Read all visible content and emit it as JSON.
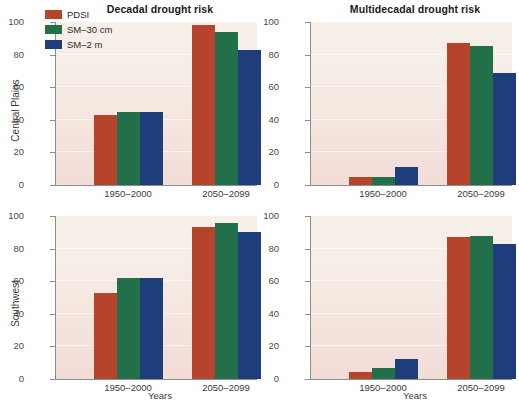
{
  "figure": {
    "xaxis_title": "Years",
    "row_labels": [
      "Central Plains",
      "Southwest"
    ],
    "column_titles": [
      "Decadal drought risk",
      "Multidecadal drought risk"
    ]
  },
  "legend": {
    "position": "top-left of first panel",
    "entries": [
      {
        "label": "PDSI",
        "color": "#b6442c"
      },
      {
        "label": "SM–30 cm",
        "color": "#22704a"
      },
      {
        "label": "SM–2 m",
        "color": "#1f3d7a"
      }
    ]
  },
  "axis": {
    "yticks": [
      0,
      20,
      40,
      60,
      80,
      100
    ],
    "ytick_labels": [
      "0",
      "20",
      "40",
      "60",
      "80",
      "100"
    ],
    "ylim": [
      0,
      100
    ],
    "xtick_labels": [
      "1950–2000",
      "2050–2099"
    ]
  },
  "chart_data": [
    {
      "type": "bar",
      "title": "Decadal drought risk",
      "panel": "Central Plains – Decadal drought risk",
      "region": "Central Plains",
      "categories": [
        "1950–2000",
        "2050–2099"
      ],
      "series": [
        {
          "name": "PDSI",
          "color": "#b6442c",
          "values": [
            43,
            98
          ]
        },
        {
          "name": "SM–30 cm",
          "color": "#22704a",
          "values": [
            45,
            94
          ]
        },
        {
          "name": "SM–2 m",
          "color": "#1f3d7a",
          "values": [
            45,
            83
          ]
        }
      ],
      "xlabel": "Years",
      "ylabel": "Central Plains",
      "ylim": [
        0,
        100
      ],
      "grid": true,
      "legend": "inside top-left"
    },
    {
      "type": "bar",
      "title": "Multidecadal drought risk",
      "panel": "Central Plains – Multidecadal drought risk",
      "region": "Central Plains",
      "categories": [
        "1950–2000",
        "2050–2099"
      ],
      "series": [
        {
          "name": "PDSI",
          "color": "#b6442c",
          "values": [
            5,
            87
          ]
        },
        {
          "name": "SM–30 cm",
          "color": "#22704a",
          "values": [
            5,
            85
          ]
        },
        {
          "name": "SM–2 m",
          "color": "#1f3d7a",
          "values": [
            11,
            69
          ]
        }
      ],
      "xlabel": "Years",
      "ylabel": "",
      "ylim": [
        0,
        100
      ],
      "grid": true,
      "legend": "none"
    },
    {
      "type": "bar",
      "title": "",
      "panel": "Southwest – Decadal drought risk",
      "region": "Southwest",
      "categories": [
        "1950–2000",
        "2050–2099"
      ],
      "series": [
        {
          "name": "PDSI",
          "color": "#b6442c",
          "values": [
            53,
            93
          ]
        },
        {
          "name": "SM–30 cm",
          "color": "#22704a",
          "values": [
            62,
            96
          ]
        },
        {
          "name": "SM–2 m",
          "color": "#1f3d7a",
          "values": [
            62,
            90
          ]
        }
      ],
      "xlabel": "Years",
      "ylabel": "Southwest",
      "ylim": [
        0,
        100
      ],
      "grid": true,
      "legend": "none"
    },
    {
      "type": "bar",
      "title": "",
      "panel": "Southwest – Multidecadal drought risk",
      "region": "Southwest",
      "categories": [
        "1950–2000",
        "2050–2099"
      ],
      "series": [
        {
          "name": "PDSI",
          "color": "#b6442c",
          "values": [
            4,
            87
          ]
        },
        {
          "name": "SM–30 cm",
          "color": "#22704a",
          "values": [
            7,
            88
          ]
        },
        {
          "name": "SM–2 m",
          "color": "#1f3d7a",
          "values": [
            12,
            83
          ]
        }
      ],
      "xlabel": "Years",
      "ylabel": "",
      "ylim": [
        0,
        100
      ],
      "grid": true,
      "legend": "none"
    }
  ]
}
